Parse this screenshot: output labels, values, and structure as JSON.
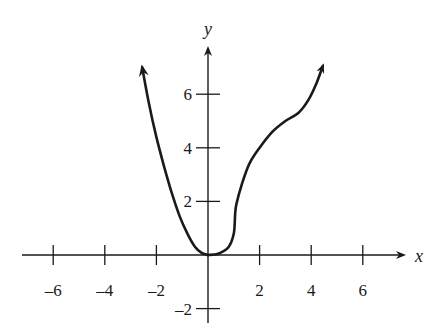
{
  "chart_data": {
    "type": "line",
    "title": "",
    "xlabel": "x",
    "ylabel": "y",
    "xlim": [
      -7.5,
      7.5
    ],
    "ylim": [
      -2.5,
      7.5
    ],
    "grid": false,
    "legend": null,
    "x_ticks": [
      -6,
      -4,
      -2,
      2,
      4,
      6
    ],
    "x_tick_labels": [
      "–6",
      "–4",
      "–2",
      "2",
      "4",
      "6"
    ],
    "y_ticks": [
      -2,
      2,
      4,
      6
    ],
    "y_tick_labels": [
      "–2",
      "2",
      "4",
      "6"
    ],
    "series": [
      {
        "name": "left branch",
        "description": "Parabola-like branch decreasing to origin; arrow at upper end indicates continuation",
        "x": [
          -2.55,
          -2.3,
          -2.0,
          -1.7,
          -1.4,
          -1.1,
          -0.8,
          -0.5,
          -0.25,
          0.0
        ],
        "y": [
          7.0,
          5.7,
          4.4,
          3.3,
          2.3,
          1.45,
          0.8,
          0.3,
          0.08,
          0.0
        ],
        "arrow_start": true
      },
      {
        "name": "right branch",
        "description": "Flat near origin, sharp rise near x=1, concave down to about (3.2,5.1) inflection, then rising; arrow at upper end",
        "x": [
          0.0,
          0.4,
          0.8,
          1.0,
          1.05,
          1.1,
          1.3,
          1.6,
          2.0,
          2.5,
          3.0,
          3.5,
          3.9,
          4.2,
          4.45
        ],
        "y": [
          0.0,
          0.05,
          0.3,
          0.8,
          1.5,
          1.9,
          2.6,
          3.4,
          4.0,
          4.6,
          5.0,
          5.3,
          5.8,
          6.4,
          7.05
        ],
        "arrow_end": true
      }
    ]
  },
  "axes": {
    "x_label": "x",
    "y_label": "y"
  }
}
